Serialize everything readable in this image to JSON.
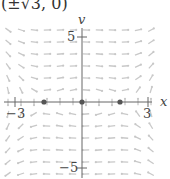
{
  "caption": "(±√3, 0)",
  "chart_data": {
    "type": "vector_field",
    "title": "(±√3, 0)",
    "xlabel": "x",
    "ylabel": "v",
    "xlim": [
      -3,
      3
    ],
    "ylim": [
      -5,
      5
    ],
    "x_ticks": [
      "−3",
      "3"
    ],
    "y_ticks": [
      "5",
      "−5"
    ],
    "equilibrium_points": [
      {
        "x": -1.732,
        "v": 0
      },
      {
        "x": 0,
        "v": 0
      },
      {
        "x": 1.732,
        "v": 0
      }
    ],
    "grid": false
  },
  "axes": {
    "x_label": "x",
    "y_label": "v",
    "x_tick_neg": "−3",
    "x_tick_pos": "3",
    "y_tick_pos": "5",
    "y_tick_neg": "−5"
  },
  "colors": {
    "axis": "#555555",
    "arrows": "#c8c8c8",
    "points": "#555555"
  }
}
